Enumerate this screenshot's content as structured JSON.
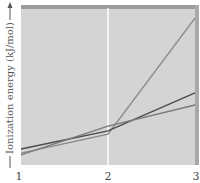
{
  "chart_data": {
    "type": "line",
    "title": "",
    "xlabel": "",
    "ylabel": "Ionization energy (kJ/mol)",
    "x": [
      1,
      2,
      3
    ],
    "x_tick_labels": [
      "1",
      "2",
      "3"
    ],
    "xlim": [
      1,
      3
    ],
    "ylim": [
      0,
      100
    ],
    "y_units": "relative (no tick values shown)",
    "grid": false,
    "legend": "none",
    "annotations": [
      {
        "type": "vertical-line",
        "x": 2,
        "color": "#ffffff"
      }
    ],
    "series": [
      {
        "name": "series-steep",
        "values": [
          7.6,
          19.7,
          93.6
        ],
        "color": "#8a8a8a"
      },
      {
        "name": "series-dark",
        "values": [
          10.2,
          21.7,
          45.9
        ],
        "color": "#4a4a4a"
      },
      {
        "name": "series-medium",
        "values": [
          6.4,
          24.8,
          38.2
        ],
        "color": "#7a7a7a"
      }
    ],
    "colors": {
      "plot_background": "#d4d4d4",
      "top_band": "#9c9c9c",
      "right_band": "#a8a8a8"
    }
  }
}
